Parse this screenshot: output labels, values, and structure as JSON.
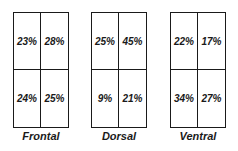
{
  "panels": [
    {
      "label": "Frontal",
      "cells": [
        "23%",
        "28%",
        "24%",
        "25%"
      ]
    },
    {
      "label": "Dorsal",
      "cells": [
        "25%",
        "45%",
        "9%",
        "21%"
      ]
    },
    {
      "label": "Ventral",
      "cells": [
        "22%",
        "17%",
        "34%",
        "27%"
      ]
    }
  ]
}
